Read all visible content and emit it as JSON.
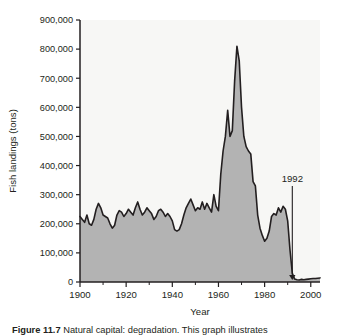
{
  "figure": {
    "caption_label": "Figure 11.7",
    "caption_rest": " Natural capital: degradation. This graph illustrates"
  },
  "chart_data": {
    "type": "area",
    "title": "",
    "xlabel": "Year",
    "ylabel": "Fish landings (tons)",
    "xlim": [
      1900,
      2004
    ],
    "ylim": [
      0,
      900000
    ],
    "grid": false,
    "legend": "none",
    "xticks": [
      1900,
      1920,
      1940,
      1960,
      1980,
      2000
    ],
    "xtick_labels": [
      "1900",
      "1920",
      "1940",
      "1960",
      "1980",
      "2000"
    ],
    "xminor_ticks": [
      1910,
      1930,
      1950,
      1970,
      1990
    ],
    "yticks": [
      0,
      100000,
      200000,
      300000,
      400000,
      500000,
      600000,
      700000,
      800000,
      900000
    ],
    "ytick_labels": [
      "0",
      "100,000",
      "200,000",
      "300,000",
      "400,000",
      "500,000",
      "600,000",
      "700,000",
      "800,000",
      "900,000"
    ],
    "area_fill_color": "#b3b3b3",
    "line_color": "#231f20",
    "plot_background": "#f7f7f5",
    "annotations": [
      {
        "label": "1992",
        "x": 1992,
        "y": 0,
        "arrow": "down-arrow",
        "label_x": 1992,
        "label_y": 330000
      }
    ],
    "x": [
      1900,
      1901,
      1902,
      1903,
      1904,
      1905,
      1906,
      1907,
      1908,
      1909,
      1910,
      1911,
      1912,
      1913,
      1914,
      1915,
      1916,
      1917,
      1918,
      1919,
      1920,
      1921,
      1922,
      1923,
      1924,
      1925,
      1926,
      1927,
      1928,
      1929,
      1930,
      1931,
      1932,
      1933,
      1934,
      1935,
      1936,
      1937,
      1938,
      1939,
      1940,
      1941,
      1942,
      1943,
      1944,
      1945,
      1946,
      1947,
      1948,
      1949,
      1950,
      1951,
      1952,
      1953,
      1954,
      1955,
      1956,
      1957,
      1958,
      1959,
      1960,
      1961,
      1962,
      1963,
      1964,
      1965,
      1966,
      1967,
      1968,
      1969,
      1970,
      1971,
      1972,
      1973,
      1974,
      1975,
      1976,
      1977,
      1978,
      1979,
      1980,
      1981,
      1982,
      1983,
      1984,
      1985,
      1986,
      1987,
      1988,
      1989,
      1990,
      1991,
      1992,
      1993,
      1994,
      1995,
      1996,
      1997,
      1998,
      1999,
      2000,
      2001,
      2002,
      2003,
      2004
    ],
    "values": [
      225000,
      215000,
      205000,
      230000,
      200000,
      195000,
      215000,
      250000,
      270000,
      255000,
      230000,
      225000,
      220000,
      200000,
      185000,
      195000,
      230000,
      245000,
      240000,
      225000,
      235000,
      250000,
      240000,
      230000,
      255000,
      275000,
      250000,
      230000,
      240000,
      255000,
      245000,
      235000,
      215000,
      225000,
      245000,
      250000,
      240000,
      225000,
      235000,
      225000,
      210000,
      180000,
      175000,
      180000,
      200000,
      230000,
      255000,
      270000,
      285000,
      265000,
      245000,
      255000,
      250000,
      275000,
      250000,
      270000,
      255000,
      240000,
      300000,
      260000,
      245000,
      370000,
      450000,
      500000,
      590000,
      500000,
      520000,
      690000,
      810000,
      760000,
      600000,
      500000,
      465000,
      450000,
      440000,
      345000,
      330000,
      230000,
      185000,
      160000,
      140000,
      150000,
      175000,
      225000,
      235000,
      230000,
      255000,
      240000,
      260000,
      250000,
      210000,
      110000,
      30000,
      10000,
      8000,
      7000,
      9000,
      8000,
      9000,
      10000,
      11000,
      12000,
      12000,
      13000,
      14000
    ]
  }
}
